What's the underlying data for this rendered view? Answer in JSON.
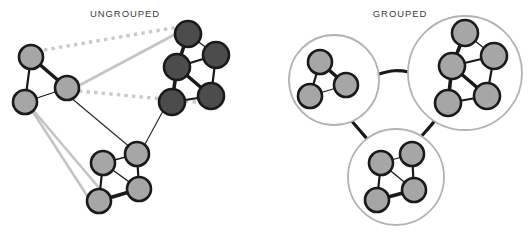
{
  "figure": {
    "background_color": "#ffffff",
    "width": 531,
    "height": 232
  },
  "panels": [
    {
      "id": "ungrouped",
      "label": "UNGROUPED",
      "label_position": {
        "x": 125,
        "y": 17
      }
    },
    {
      "id": "grouped",
      "label": "GROUPED",
      "label_position": {
        "x": 400,
        "y": 17
      }
    }
  ],
  "colors": {
    "node_light_fill": "#a6a6a6",
    "node_dark_fill": "#4c4c4c",
    "node_stroke": "#1a1a1a",
    "edge_intra": "#1a1a1a",
    "edge_thin": "#2b2b2b",
    "edge_light_gray": "#c4c4c4",
    "edge_dotted": "#c9c9c9",
    "group_circle_stroke": "#b3b3b3",
    "group_link": "#1a1a1a",
    "label_text": "#3a3a3a",
    "background": "#ffffff"
  },
  "ungrouped": {
    "clusters": [
      {
        "id": "cluster-a",
        "shade": "light",
        "nodes": [
          {
            "id": "a1",
            "x": 31,
            "y": 57,
            "r": 12
          },
          {
            "id": "a2",
            "x": 67,
            "y": 88,
            "r": 12
          },
          {
            "id": "a3",
            "x": 25,
            "y": 102,
            "r": 12
          }
        ],
        "edges": [
          {
            "from": "a1",
            "to": "a2",
            "weight": "thick"
          },
          {
            "from": "a1",
            "to": "a3",
            "weight": "medium"
          },
          {
            "from": "a2",
            "to": "a3",
            "weight": "thin"
          }
        ]
      },
      {
        "id": "cluster-b",
        "shade": "dark",
        "nodes": [
          {
            "id": "b1",
            "x": 188,
            "y": 34,
            "r": 13
          },
          {
            "id": "b2",
            "x": 216,
            "y": 55,
            "r": 13
          },
          {
            "id": "b3",
            "x": 177,
            "y": 67,
            "r": 13
          },
          {
            "id": "b4",
            "x": 211,
            "y": 96,
            "r": 13
          },
          {
            "id": "b5",
            "x": 172,
            "y": 102,
            "r": 13
          }
        ],
        "edges": [
          {
            "from": "b1",
            "to": "b3",
            "weight": "thick"
          },
          {
            "from": "b1",
            "to": "b2",
            "weight": "thin"
          },
          {
            "from": "b2",
            "to": "b3",
            "weight": "medium"
          },
          {
            "from": "b2",
            "to": "b4",
            "weight": "medium"
          },
          {
            "from": "b3",
            "to": "b4",
            "weight": "thick"
          },
          {
            "from": "b3",
            "to": "b5",
            "weight": "thick"
          },
          {
            "from": "b4",
            "to": "b5",
            "weight": "medium"
          }
        ]
      },
      {
        "id": "cluster-c",
        "shade": "light",
        "nodes": [
          {
            "id": "c1",
            "x": 103,
            "y": 163,
            "r": 12
          },
          {
            "id": "c2",
            "x": 137,
            "y": 154,
            "r": 12
          },
          {
            "id": "c3",
            "x": 139,
            "y": 189,
            "r": 12
          },
          {
            "id": "c4",
            "x": 99,
            "y": 201,
            "r": 12
          }
        ],
        "edges": [
          {
            "from": "c1",
            "to": "c2",
            "weight": "thin"
          },
          {
            "from": "c2",
            "to": "c3",
            "weight": "medium"
          },
          {
            "from": "c1",
            "to": "c4",
            "weight": "medium"
          },
          {
            "from": "c3",
            "to": "c4",
            "weight": "thick"
          },
          {
            "from": "c1",
            "to": "c3",
            "weight": "thin"
          }
        ]
      }
    ],
    "inter_cluster_edges": [
      {
        "id": "dotted-top",
        "style": "dotted",
        "from": [
          44,
          50
        ],
        "to": [
          184,
          26
        ]
      },
      {
        "id": "dotted-mid",
        "style": "dotted",
        "from": [
          79,
          91
        ],
        "to": [
          205,
          103
        ]
      },
      {
        "id": "gray-diag",
        "style": "solid-gray",
        "from": [
          80,
          85
        ],
        "to": [
          187,
          28
        ]
      },
      {
        "id": "gray-lower-1",
        "style": "solid-gray",
        "from": [
          33,
          110
        ],
        "to": [
          106,
          196
        ]
      },
      {
        "id": "gray-lower-2",
        "style": "solid-gray",
        "from": [
          33,
          112
        ],
        "to": [
          95,
          208
        ]
      },
      {
        "id": "black-a2-c2",
        "style": "thin-black",
        "from": [
          70,
          97
        ],
        "to": [
          131,
          148
        ]
      },
      {
        "id": "black-b5-c2",
        "style": "thin-black",
        "from": [
          163,
          111
        ],
        "to": [
          144,
          146
        ]
      }
    ]
  },
  "grouped": {
    "groups": [
      {
        "id": "group-a",
        "label_shade": "light",
        "circle": {
          "cx": 334,
          "cy": 80,
          "r": 45
        },
        "nodes": [
          {
            "id": "ga1",
            "x": 320,
            "y": 62,
            "r": 12
          },
          {
            "id": "ga2",
            "x": 346,
            "y": 85,
            "r": 12
          },
          {
            "id": "ga3",
            "x": 310,
            "y": 96,
            "r": 12
          }
        ],
        "edges": [
          {
            "from": "ga1",
            "to": "ga2",
            "weight": "thick"
          },
          {
            "from": "ga1",
            "to": "ga3",
            "weight": "medium"
          },
          {
            "from": "ga2",
            "to": "ga3",
            "weight": "thin"
          }
        ]
      },
      {
        "id": "group-b",
        "label_shade": "dark",
        "circle": {
          "cx": 465,
          "cy": 73,
          "r": 57
        },
        "nodes": [
          {
            "id": "gb1",
            "x": 465,
            "y": 33,
            "r": 13
          },
          {
            "id": "gb2",
            "x": 494,
            "y": 56,
            "r": 13
          },
          {
            "id": "gb3",
            "x": 452,
            "y": 66,
            "r": 13
          },
          {
            "id": "gb4",
            "x": 487,
            "y": 96,
            "r": 13
          },
          {
            "id": "gb5",
            "x": 448,
            "y": 103,
            "r": 13
          }
        ],
        "edges": [
          {
            "from": "gb1",
            "to": "gb3",
            "weight": "thick"
          },
          {
            "from": "gb1",
            "to": "gb2",
            "weight": "thin"
          },
          {
            "from": "gb2",
            "to": "gb3",
            "weight": "medium"
          },
          {
            "from": "gb2",
            "to": "gb4",
            "weight": "medium"
          },
          {
            "from": "gb3",
            "to": "gb4",
            "weight": "thick"
          },
          {
            "from": "gb3",
            "to": "gb5",
            "weight": "thick"
          },
          {
            "from": "gb4",
            "to": "gb5",
            "weight": "medium"
          }
        ]
      },
      {
        "id": "group-c",
        "label_shade": "light",
        "circle": {
          "cx": 396,
          "cy": 177,
          "r": 48
        },
        "nodes": [
          {
            "id": "gc1",
            "x": 381,
            "y": 163,
            "r": 12
          },
          {
            "id": "gc2",
            "x": 412,
            "y": 154,
            "r": 12
          },
          {
            "id": "gc3",
            "x": 414,
            "y": 190,
            "r": 12
          },
          {
            "id": "gc4",
            "x": 377,
            "y": 200,
            "r": 12
          }
        ],
        "edges": [
          {
            "from": "gc1",
            "to": "gc2",
            "weight": "thin"
          },
          {
            "from": "gc2",
            "to": "gc3",
            "weight": "medium"
          },
          {
            "from": "gc1",
            "to": "gc4",
            "weight": "medium"
          },
          {
            "from": "gc3",
            "to": "gc4",
            "weight": "thick"
          },
          {
            "from": "gc1",
            "to": "gc3",
            "weight": "thin"
          }
        ]
      }
    ],
    "group_links": [
      {
        "id": "link-a-b",
        "from": "group-a",
        "to": "group-b",
        "path": "M379,74 C392,70 398,70 409,72"
      },
      {
        "id": "link-a-c",
        "from": "group-a",
        "to": "group-c",
        "path": "M349,118 C357,127 362,133 368,140"
      },
      {
        "id": "link-b-c",
        "from": "group-b",
        "to": "group-c",
        "path": "M437,118 C430,127 425,132 419,139"
      }
    ]
  }
}
